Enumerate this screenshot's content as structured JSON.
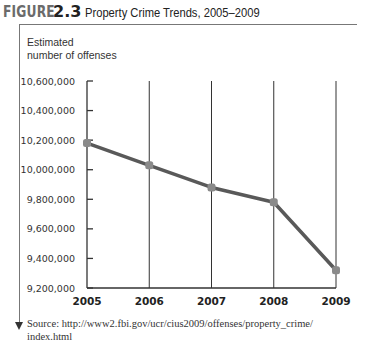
{
  "figure": {
    "label_word": "FIGURE",
    "label_number": "2.3",
    "title": "Property Crime Trends, 2005–2009"
  },
  "axis": {
    "ylabel_line1": "Estimated",
    "ylabel_line2": "number of offenses"
  },
  "source": {
    "line1": "Source: http://www2.fbi.gov/ucr/cius2009/offenses/property_crime/",
    "line2": "index.html"
  },
  "colors": {
    "line": "#595959",
    "marker": "#8a8a8a",
    "axis": "#333333"
  },
  "chart_data": {
    "type": "line",
    "title": "Property Crime Trends, 2005–2009",
    "xlabel": "",
    "ylabel": "Estimated number of offenses",
    "categories": [
      "2005",
      "2006",
      "2007",
      "2008",
      "2009"
    ],
    "series": [
      {
        "name": "Property crime offenses",
        "values": [
          10180000,
          10030000,
          9880000,
          9780000,
          9320000
        ]
      }
    ],
    "yticks": [
      9200000,
      9400000,
      9600000,
      9800000,
      10000000,
      10200000,
      10400000,
      10600000
    ],
    "ytick_labels": [
      "9,200,000",
      "9,400,000",
      "9,600,000",
      "9,800,000",
      "10,000,000",
      "10,200,000",
      "10,400,000",
      "10,600,000"
    ],
    "ylim": [
      9200000,
      10600000
    ],
    "grid": "vertical lines at each year",
    "legend": "none"
  }
}
